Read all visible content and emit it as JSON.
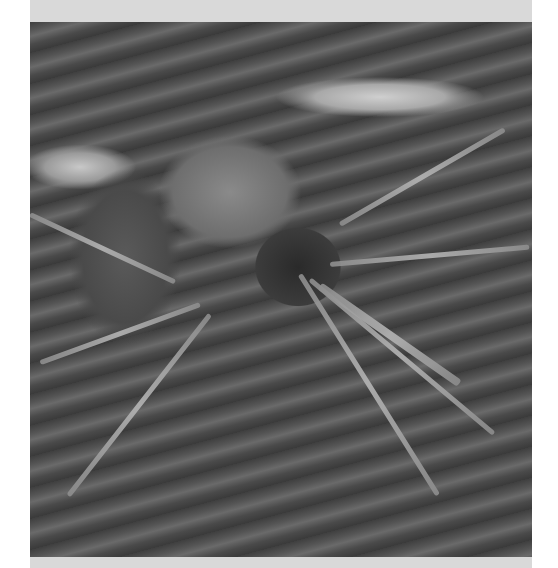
{
  "image": {
    "subject": "mosquito",
    "description": "Grayscale scanning electron micrograph of a mosquito resting on a textured skin surface",
    "style": "grayscale",
    "frame_color": "#d9d9d9"
  }
}
